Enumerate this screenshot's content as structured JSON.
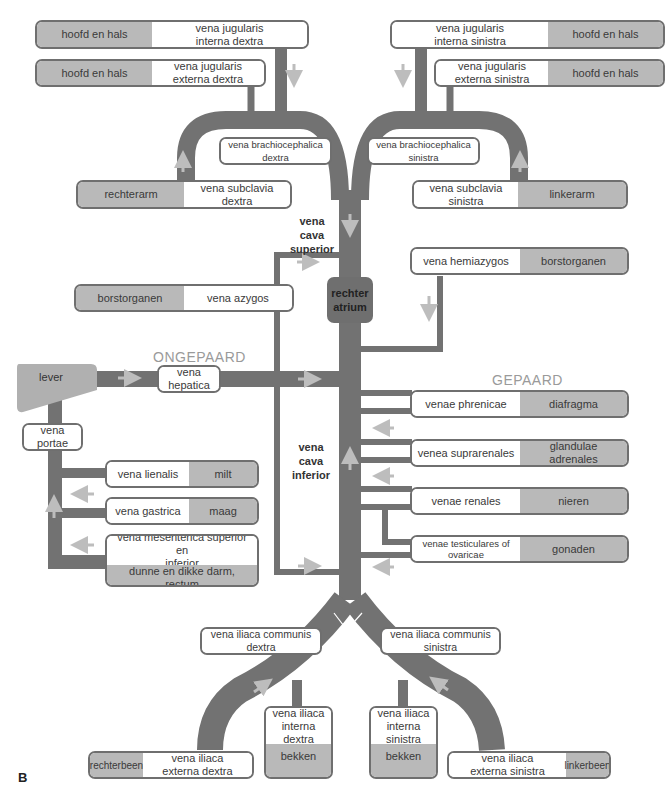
{
  "figure_label": "B",
  "colors": {
    "vessel": "#727272",
    "box_border": "#6f6f6f",
    "organ_fill": "#b9b9b9",
    "arrow": "#bdbdbd",
    "section_text": "#9a9a9a"
  },
  "sections": {
    "unpaired": "ONGEPAARD",
    "paired": "GEPAARD"
  },
  "center": {
    "vcs": "vena cava superior",
    "vcs_l1": "vena cava",
    "vcs_l2": "superior",
    "vci_l1": "vena cava",
    "vci_l2": "inferior",
    "atrium_l1": "rechter",
    "atrium_l2": "atrium"
  },
  "upper_right_side": {
    "jug_int": {
      "organ": "hoofd en hals",
      "vein_l1": "vena jugularis",
      "vein_l2": "interna dextra"
    },
    "jug_ext": {
      "organ": "hoofd en hals",
      "vein_l1": "vena jugularis",
      "vein_l2": "externa dextra"
    },
    "brachio": "vena brachiocephalica dextra",
    "subclavia": {
      "organ": "rechterarm",
      "vein": "vena subclavia dextra"
    }
  },
  "upper_left_side": {
    "jug_int": {
      "organ": "hoofd en hals",
      "vein_l1": "vena jugularis",
      "vein_l2": "interna sinistra"
    },
    "jug_ext": {
      "organ": "hoofd en hals",
      "vein_l1": "vena jugularis",
      "vein_l2": "externa sinistra"
    },
    "brachio": "vena brachiocephalica sinistra",
    "subclavia": {
      "organ": "linkerarm",
      "vein": "vena subclavia sinistra"
    }
  },
  "azygos": {
    "organ": "borstorganen",
    "vein": "vena azygos"
  },
  "hemiazygos": {
    "organ": "borstorganen",
    "vein": "vena hemiazygos"
  },
  "unpaired": {
    "lever": "lever",
    "hepatica": "vena hepatica",
    "portae": "vena portae",
    "lienalis": {
      "vein": "vena lienalis",
      "organ": "milt"
    },
    "gastrica": {
      "vein": "vena gastrica",
      "organ": "maag"
    },
    "mesenterica": {
      "vein_l1": "vena mesenterica superior en",
      "vein_l2": "inferior",
      "organ": "dunne en dikke darm, rectum"
    }
  },
  "paired": {
    "phrenicae": {
      "vein": "venae phrenicae",
      "organ": "diafragma"
    },
    "suprarenales": {
      "vein": "venea suprarenales",
      "organ": "glandulae adrenales"
    },
    "renales": {
      "vein": "venae renales",
      "organ": "nieren"
    },
    "testiculares": {
      "vein_l1": "venae testiculares of",
      "vein_l2": "ovaricae",
      "organ": "gonaden"
    }
  },
  "lower": {
    "comm_dextra": "vena iliaca communis dextra",
    "comm_sinistra": "vena iliaca communis sinistra",
    "int_dextra": {
      "vein_l1": "vena iliaca",
      "vein_l2": "interna dextra",
      "organ": "bekken"
    },
    "int_sinistra": {
      "vein_l1": "vena iliaca",
      "vein_l2": "interna sinistra",
      "organ": "bekken"
    },
    "ext_dextra": {
      "organ": "rechterbeen",
      "vein_l1": "vena iliaca",
      "vein_l2": "externa dextra"
    },
    "ext_sinistra": {
      "vein_l1": "vena iliaca",
      "vein_l2": "externa sinistra",
      "organ": "linkerbeen"
    }
  }
}
